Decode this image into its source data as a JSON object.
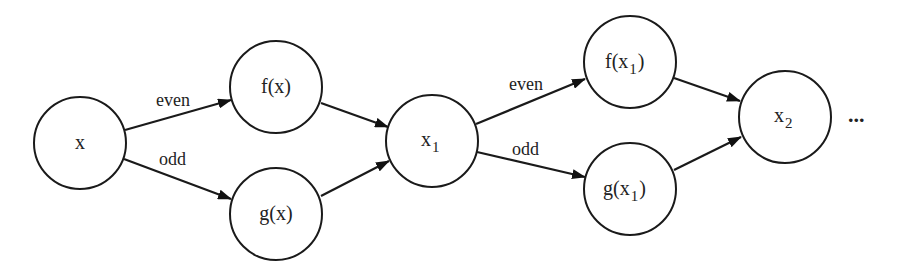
{
  "diagram": {
    "type": "state-transition-graph",
    "colors": {
      "stroke": "#1a1a1a",
      "fill": "#ffffff",
      "text": "#222222",
      "background": "#ffffff"
    },
    "nodes": [
      {
        "id": "x",
        "base": "x",
        "sub": "",
        "suffix": "",
        "cx": 80,
        "cy": 143,
        "r": 46
      },
      {
        "id": "fx",
        "base": "f(x",
        "sub": "",
        "suffix": ")",
        "cx": 276,
        "cy": 87,
        "r": 46
      },
      {
        "id": "gx",
        "base": "g(x",
        "sub": "",
        "suffix": ")",
        "cx": 276,
        "cy": 214,
        "r": 46
      },
      {
        "id": "x1",
        "base": "x",
        "sub": "1",
        "suffix": "",
        "cx": 432,
        "cy": 141,
        "r": 46
      },
      {
        "id": "fx1",
        "base": "f(x",
        "sub": "1",
        "suffix": ")",
        "cx": 630,
        "cy": 62,
        "r": 46
      },
      {
        "id": "gx1",
        "base": "g(x",
        "sub": "1",
        "suffix": ")",
        "cx": 630,
        "cy": 189,
        "r": 46
      },
      {
        "id": "x2",
        "base": "x",
        "sub": "2",
        "suffix": "",
        "cx": 785,
        "cy": 117,
        "r": 46
      }
    ],
    "edges": [
      {
        "from": "x",
        "to": "fx",
        "label": "even"
      },
      {
        "from": "x",
        "to": "gx",
        "label": "odd"
      },
      {
        "from": "fx",
        "to": "x1",
        "label": ""
      },
      {
        "from": "gx",
        "to": "x1",
        "label": ""
      },
      {
        "from": "x1",
        "to": "fx1",
        "label": "even"
      },
      {
        "from": "x1",
        "to": "gx1",
        "label": "odd"
      },
      {
        "from": "fx1",
        "to": "x2",
        "label": ""
      },
      {
        "from": "gx1",
        "to": "x2",
        "label": ""
      }
    ],
    "edge_labels": {
      "e1": "even",
      "e2": "odd",
      "e3": "even",
      "e4": "odd"
    },
    "node_labels": {
      "x": {
        "base": "x"
      },
      "fx": {
        "base": "f(x)"
      },
      "gx": {
        "base": "g(x)"
      },
      "x1": {
        "base": "x",
        "sub": "1"
      },
      "fx1": {
        "base": "f(x",
        "sub": "1",
        "suffix": ")"
      },
      "gx1": {
        "base": "g(x",
        "sub": "1",
        "suffix": ")"
      },
      "x2": {
        "base": "x",
        "sub": "2"
      }
    },
    "continuation": "..."
  }
}
